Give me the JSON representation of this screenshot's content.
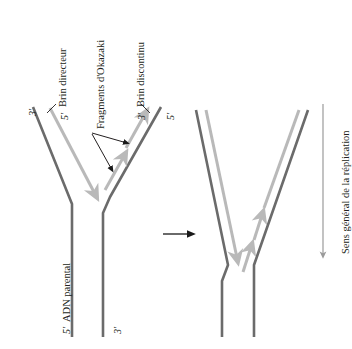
{
  "figure": {
    "title_implicit": "Réplication de l'ADN - fourche de réplication",
    "colors": {
      "parental_strand": "#6b6b6b",
      "new_strand": "#b9b9b9",
      "leader_line": "#231f20",
      "text": "#231f20",
      "transition_arrow": "#1a1a1a",
      "direction_arrow": "#9a9a9a",
      "background": "#ffffff"
    },
    "left_panel": {
      "labels": {
        "leading_strand": "Brin directeur",
        "okazaki_fragments": "Fragments d'Okazaki",
        "lagging_strand": "Brin discontinu",
        "parental_dna": "ADN parental"
      },
      "prime_ends": {
        "outer_left": "3'",
        "inner_left": "5'",
        "inner_right": "3'",
        "outer_right": "5'",
        "bottom_left": "5'",
        "bottom_right": "3'"
      }
    },
    "transition": {
      "arrow_icon": "right-arrow-icon"
    },
    "right_panel": {
      "description": "fourche de réplication avancée"
    },
    "direction_legend": {
      "label": "Sens général de la réplication",
      "arrow_icon": "down-arrow-icon"
    }
  }
}
